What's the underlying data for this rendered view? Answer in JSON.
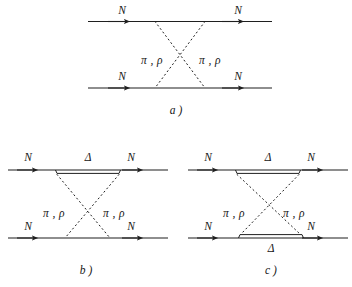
{
  "figure": {
    "ink_color": "#1f1f1f",
    "background_color": "#ffffff",
    "particles": {
      "nucleon": "N",
      "delta": "Δ",
      "mesons": "π , ρ"
    },
    "panels": [
      {
        "id": "a",
        "caption": "a )",
        "description": "Crossed two-meson exchange between two nucleon lines",
        "top_line": {
          "left_label": "N",
          "right_label": "N",
          "type": "nucleon-single"
        },
        "bottom_line": {
          "left_label": "N",
          "right_label": "N",
          "type": "nucleon-single"
        },
        "exchange_labels": {
          "left": "π , ρ",
          "right": "π , ρ"
        }
      },
      {
        "id": "b",
        "caption": "b )",
        "description": "Crossed two-meson exchange with a Delta on the upper line",
        "top_line": {
          "left_label": "N",
          "right_label": "N",
          "middle_label": "Δ",
          "type": "nucleon-with-delta"
        },
        "bottom_line": {
          "left_label": "N",
          "right_label": "N",
          "type": "nucleon-single"
        },
        "exchange_labels": {
          "left": "π , ρ",
          "right": "π , ρ"
        }
      },
      {
        "id": "c",
        "caption": "c )",
        "description": "Crossed two-meson exchange with a Delta on both lines",
        "top_line": {
          "left_label": "N",
          "right_label": "N",
          "middle_label": "Δ",
          "type": "nucleon-with-delta"
        },
        "bottom_line": {
          "left_label": "N",
          "right_label": "N",
          "middle_label": "Δ",
          "type": "nucleon-with-delta"
        },
        "exchange_labels": {
          "left": "π , ρ",
          "right": "π , ρ"
        }
      }
    ]
  }
}
